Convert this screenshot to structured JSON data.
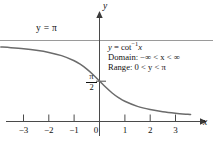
{
  "figure": {
    "background_color": "#ffffff",
    "curve_color": "#6b6b6b",
    "axis_color": "#3a3a3a",
    "asymptote_color": "#9a9a9a"
  },
  "labels": {
    "asymptote": "y = π",
    "y_axis": "y",
    "x_axis": "x",
    "pi_half_numerator": "π",
    "pi_half_denominator": "2"
  },
  "info_box": {
    "equation_lhs": "y",
    "equation_eq": "=",
    "equation_fn": "cot",
    "equation_exp": "−1",
    "equation_arg": "x",
    "equation_full": "y = cot⁻¹x",
    "domain_label": "Domain:",
    "domain_value": "−∞ < x < ∞",
    "range_label": "Range:",
    "range_value": "0 < y < π"
  },
  "axes": {
    "x_tick_labels": [
      "−3",
      "−2",
      "−1",
      "0",
      "1",
      "2",
      "3"
    ],
    "x_tick_values": [
      -3,
      -2,
      -1,
      0,
      1,
      2,
      3
    ],
    "y_tick_labels": [
      "π/2"
    ],
    "y_tick_values": [
      1.5707963
    ]
  },
  "chart_data": {
    "type": "line",
    "title": "",
    "subtitle": "",
    "xlabel": "x",
    "ylabel": "y",
    "xlim": [
      -3.9,
      3.6
    ],
    "ylim": [
      -0.35,
      3.75
    ],
    "grid": false,
    "legend": "none",
    "annotations": [
      {
        "text": "y = π",
        "x": -2.45,
        "y": 3.45,
        "role": "asymptote-label"
      },
      {
        "text": "y = cot⁻¹x",
        "x": 0.45,
        "y": 2.95,
        "role": "equation"
      },
      {
        "text": "Domain: −∞ < x < ∞",
        "x": 0.45,
        "y": 2.6,
        "role": "domain"
      },
      {
        "text": "Range: 0 < y < π",
        "x": 0.45,
        "y": 2.25,
        "role": "range"
      }
    ],
    "reference_lines": [
      {
        "name": "y = π asymptote",
        "orientation": "horizontal",
        "value": 3.14159
      },
      {
        "name": "y = 0 asymptote (x-axis)",
        "orientation": "horizontal",
        "value": 0
      }
    ],
    "series": [
      {
        "name": "y = cot⁻¹x",
        "x": [
          -3.9,
          -3.5,
          -3.0,
          -2.5,
          -2.0,
          -1.5,
          -1.0,
          -0.75,
          -0.5,
          -0.25,
          0.0,
          0.25,
          0.5,
          0.75,
          1.0,
          1.5,
          2.0,
          2.5,
          3.0,
          3.5,
          3.6
        ],
        "values": [
          2.889,
          2.863,
          2.82,
          2.761,
          2.678,
          2.554,
          2.356,
          2.214,
          2.034,
          1.816,
          1.5708,
          1.326,
          1.107,
          0.927,
          0.785,
          0.588,
          0.464,
          0.38,
          0.322,
          0.278,
          0.271
        ]
      }
    ]
  }
}
